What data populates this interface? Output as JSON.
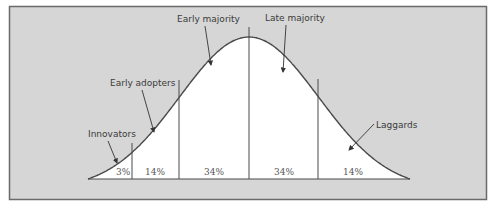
{
  "diagram": {
    "colors": {
      "background_panel": "#d6d6d6",
      "curve_fill": "#ffffff",
      "line": "#4a4a4a",
      "text": "#3a3a3a"
    },
    "categories": [
      {
        "name": "Innovators",
        "percent": "3%"
      },
      {
        "name": "Early adopters",
        "percent": "14%"
      },
      {
        "name": "Early majority",
        "percent": "34%"
      },
      {
        "name": "Late majority",
        "percent": "34%"
      },
      {
        "name": "Laggards",
        "percent": "14%"
      }
    ]
  }
}
